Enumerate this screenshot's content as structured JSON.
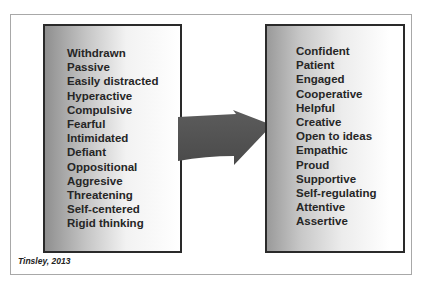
{
  "diagram": {
    "before_box": {
      "items": [
        "Withdrawn",
        "Passive",
        "Easily distracted",
        "Hyperactive",
        "Compulsive",
        "Fearful",
        "Intimidated",
        "Defiant",
        "Oppositional",
        "Aggresive",
        "Threatening",
        "Self-centered",
        "Rigid thinking"
      ]
    },
    "after_box": {
      "items": [
        "Confident",
        "Patient",
        "Engaged",
        "Cooperative",
        "Helpful",
        "Creative",
        "Open to ideas",
        "Empathic",
        "Proud",
        "Supportive",
        "Self-regulating",
        "Attentive",
        "Assertive"
      ]
    },
    "arrow": {
      "icon": "right-arrow-icon",
      "color": "#555555"
    },
    "caption": "Tinsley, 2013"
  }
}
